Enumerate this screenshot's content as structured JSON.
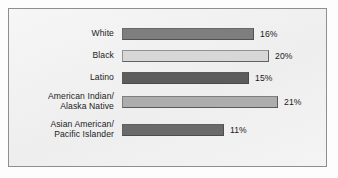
{
  "chart_data": {
    "type": "bar",
    "orientation": "horizontal",
    "title": "",
    "subtitle": "",
    "xlabel": "",
    "ylabel": "",
    "grid": false,
    "legend": null,
    "value_suffix": "%",
    "categories": [
      "White",
      "Black",
      "Latino",
      "American Indian/\nAlaska Native",
      "Asian American/\nPacific Islander"
    ],
    "values": [
      16,
      20,
      15,
      21,
      11
    ],
    "value_labels": [
      "16%",
      "20%",
      "15%",
      "21%",
      "11%"
    ],
    "bar_colors": [
      "#7e7e7e",
      "#d7d7d7",
      "#5c5c5c",
      "#adadad",
      "#6a6a6a"
    ],
    "bar_pixel_lengths": [
      132,
      147,
      127,
      156,
      102
    ],
    "bars": [
      {
        "label": "White",
        "value": 16,
        "value_label": "16%",
        "color": "#7e7e7e",
        "pixel_length": 132
      },
      {
        "label": "Black",
        "value": 20,
        "value_label": "20%",
        "color": "#d7d7d7",
        "pixel_length": 147
      },
      {
        "label": "Latino",
        "value": 15,
        "value_label": "15%",
        "color": "#5c5c5c",
        "pixel_length": 127
      },
      {
        "label": "American Indian/\nAlaska Native",
        "value": 21,
        "value_label": "21%",
        "color": "#adadad",
        "pixel_length": 156
      },
      {
        "label": "Asian American/\nPacific Islander",
        "value": 11,
        "value_label": "11%",
        "color": "#6a6a6a",
        "pixel_length": 102
      }
    ]
  },
  "style": {
    "frame_border_color": "#8e8e8e",
    "panel_background": "#f2f2f2",
    "text_color": "#1b1b1b"
  }
}
